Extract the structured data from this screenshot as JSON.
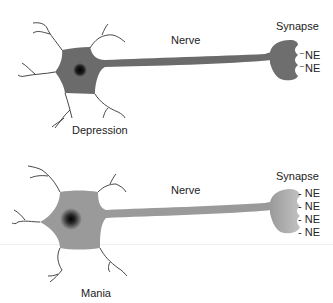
{
  "diagram": {
    "top": {
      "condition_label": "Depression",
      "nerve_label": "Nerve",
      "synapse_label": "Synapse",
      "neurotransmitters": [
        "NE",
        "NE"
      ],
      "neuron_color": "#6b6b6b",
      "nucleus_color": "#111111"
    },
    "bottom": {
      "condition_label": "Mania",
      "nerve_label": "Nerve",
      "synapse_label": "Synapse",
      "neurotransmitters": [
        "- NE",
        "- NE",
        "- NE",
        "- NE"
      ],
      "neuron_color": "#9a9a9a",
      "nucleus_color": "#111111"
    }
  }
}
